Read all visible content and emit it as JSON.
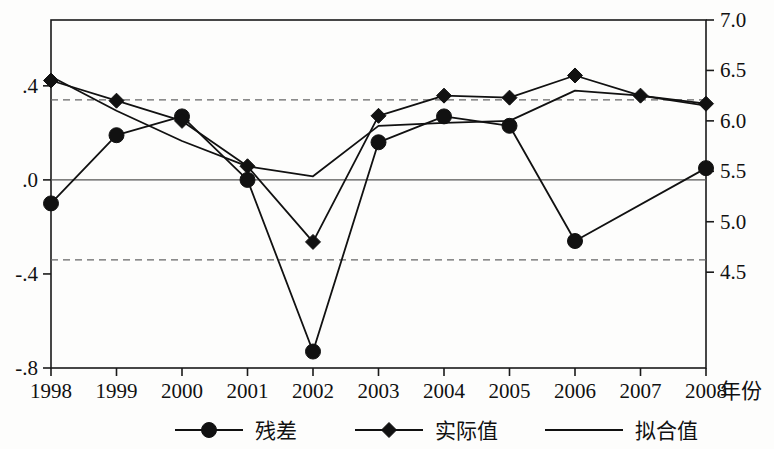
{
  "chart_data": {
    "type": "line",
    "title": "",
    "xlabel": "年份",
    "x": [
      "1998",
      "1999",
      "2000",
      "2001",
      "2002",
      "2003",
      "2004",
      "2005",
      "2006",
      "2007",
      "2008"
    ],
    "left_axis": {
      "name": "residual",
      "ticks": [
        ".4",
        ".0",
        "-.4",
        "-.8"
      ],
      "tick_values": [
        0.4,
        0.0,
        -0.4,
        -0.8
      ],
      "ylim": [
        -0.8,
        0.68
      ],
      "zero_line": 0.0,
      "threshold_lines": [
        0.34,
        -0.34
      ]
    },
    "right_axis": {
      "name": "level",
      "ticks": [
        "7.0",
        "6.5",
        "6.0",
        "5.5",
        "5.0",
        "4.5"
      ],
      "tick_values": [
        7.0,
        6.5,
        6.0,
        5.5,
        5.0,
        4.5
      ],
      "ylim": [
        3.55,
        7.0
      ]
    },
    "grid": false,
    "legend_position": "bottom",
    "series": [
      {
        "name": "残差",
        "key": "residual",
        "axis": "left",
        "marker": "circle",
        "values": [
          -0.1,
          0.19,
          0.27,
          0.0,
          -0.73,
          0.16,
          0.27,
          0.23,
          -0.26,
          null,
          0.05
        ]
      },
      {
        "name": "实际值",
        "key": "actual",
        "axis": "right",
        "marker": "diamond",
        "values": [
          6.4,
          6.2,
          6.0,
          5.55,
          4.8,
          6.05,
          6.25,
          6.23,
          6.45,
          6.25,
          6.17
        ]
      },
      {
        "name": "拟合值",
        "key": "fitted",
        "axis": "right",
        "marker": "none",
        "values": [
          6.44,
          6.1,
          5.8,
          5.55,
          5.45,
          5.95,
          5.98,
          6.0,
          6.3,
          6.25,
          6.15
        ]
      }
    ]
  },
  "legend": {
    "items": [
      {
        "label": "残差",
        "marker": "circle"
      },
      {
        "label": "实际值",
        "marker": "diamond"
      },
      {
        "label": "拟合值",
        "marker": "none"
      }
    ]
  },
  "colors": {
    "ink": "#111111",
    "axis": "#1a1a1a",
    "zero": "#555555",
    "threshold": "#666666",
    "background": "#fdfdfc"
  }
}
